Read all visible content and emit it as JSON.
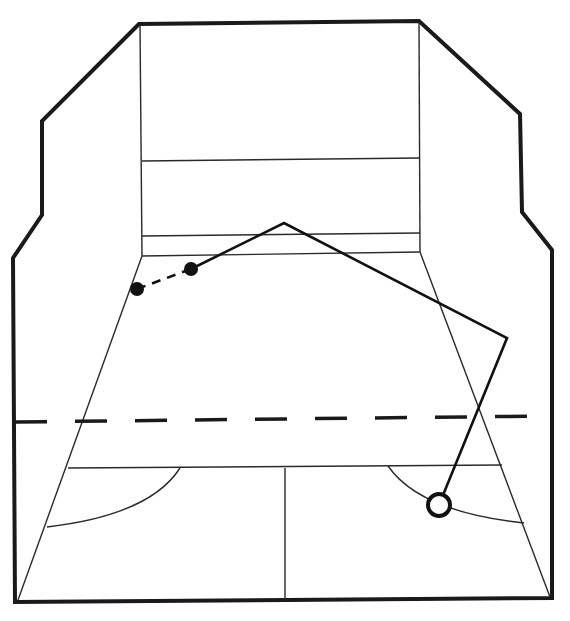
{
  "diagram": {
    "kind": "squash-court-perspective",
    "colors": {
      "ink": "#111111",
      "background": "#ffffff"
    },
    "court": {
      "outer_outline": [
        [
          139,
          24
        ],
        [
          42,
          121
        ],
        [
          42,
          215
        ],
        [
          13,
          258
        ],
        [
          15,
          602
        ],
        [
          552,
          598
        ],
        [
          552,
          250
        ],
        [
          522,
          212
        ],
        [
          520,
          114
        ],
        [
          419,
          21
        ]
      ],
      "front_wall": {
        "left_x": 142,
        "right_x": 420,
        "top_y": 22,
        "bottom_y": 255
      },
      "front_wall_lines": [
        {
          "name": "service-line",
          "y_left": 161,
          "y_right": 158
        },
        {
          "name": "tin-top",
          "y_left": 236,
          "y_right": 233
        },
        {
          "name": "floor-junction",
          "y_left": 256,
          "y_right": 252
        }
      ],
      "side_floor_lines": [
        {
          "name": "left-floor-edge",
          "from": [
            142,
            256
          ],
          "to": [
            18,
            600
          ]
        },
        {
          "name": "right-floor-edge",
          "from": [
            420,
            252
          ],
          "to": [
            550,
            597
          ]
        }
      ],
      "short_line": {
        "y_left": 468,
        "y_right": 465,
        "x_left": 68,
        "x_right": 502
      },
      "half_court_line": {
        "x": 285,
        "from_y": 468,
        "to_y": 600
      },
      "service_boxes": [
        {
          "name": "left-service-box-arc",
          "from": [
            180,
            468
          ],
          "to": [
            47,
            527
          ]
        },
        {
          "name": "right-service-box-arc",
          "from": [
            388,
            466
          ],
          "to": [
            524,
            523
          ]
        }
      ],
      "dashed_reference_line": {
        "from": [
          15,
          422
        ],
        "to": [
          548,
          416
        ]
      }
    },
    "shot": {
      "start_dot": [
        137,
        289
      ],
      "contact_dot": [
        191,
        269
      ],
      "front_wall_hit": [
        284,
        223
      ],
      "side_wall_hit": [
        507,
        338
      ],
      "landing_point": [
        439,
        505
      ],
      "segments": [
        {
          "style": "dashed",
          "label": "approach"
        },
        {
          "style": "solid",
          "label": "ball path"
        }
      ],
      "markers": [
        {
          "name": "player-start",
          "type": "filled-dot"
        },
        {
          "name": "contact-point",
          "type": "filled-dot"
        },
        {
          "name": "ball-landing",
          "type": "open-circle"
        }
      ]
    }
  }
}
